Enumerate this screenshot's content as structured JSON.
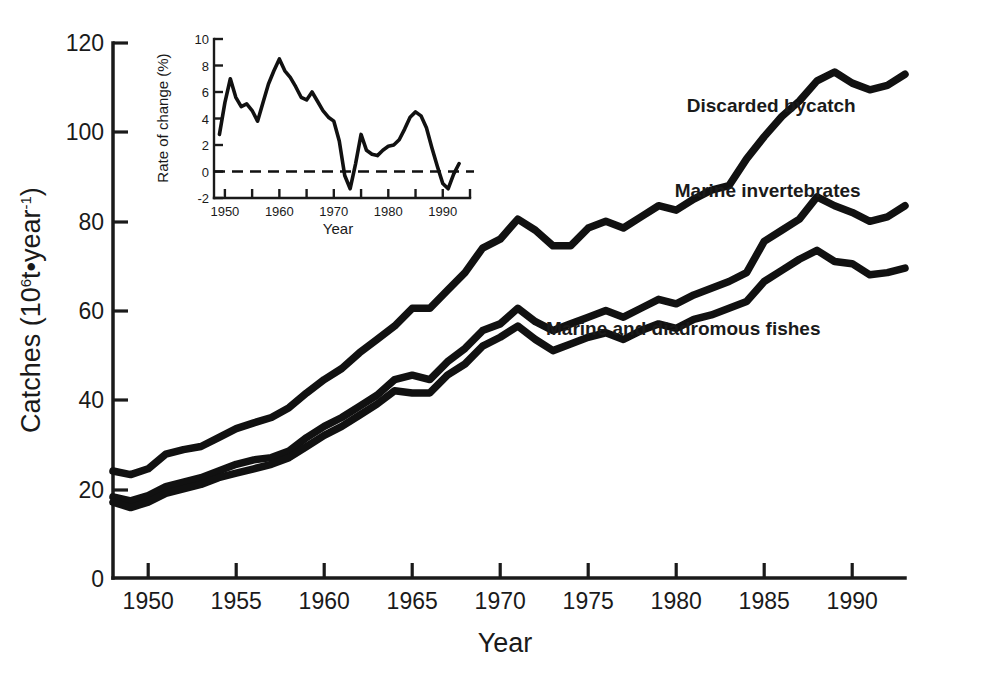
{
  "figure": {
    "name": "world-fisheries-catches-figure",
    "background": "#ffffff",
    "ink_color": "#111111"
  },
  "chart_data": {
    "type": "line",
    "title": "",
    "xlabel": "Year",
    "ylabel": "Catches (10⁶·t·year⁻¹)",
    "ylabel_parts": {
      "prefix": "Catches (10",
      "exponent": "6",
      "mid": "t•year",
      "exp2": "-1",
      "suffix": ")"
    },
    "xlim": [
      1948,
      1993
    ],
    "ylim": [
      0,
      120
    ],
    "xticks": [
      1950,
      1955,
      1960,
      1965,
      1970,
      1975,
      1980,
      1985,
      1990
    ],
    "xticklabels": [
      "1950",
      "1955",
      "1960",
      "1965",
      "1970",
      "1975",
      "1980",
      "1985",
      "1990"
    ],
    "yticks": [
      0,
      20,
      40,
      60,
      80,
      100,
      120
    ],
    "yticklabels": [
      "0",
      "20",
      "40",
      "60",
      "80",
      "100",
      "120"
    ],
    "grid": false,
    "legend_position": "inline-annotations",
    "x": [
      1948,
      1949,
      1950,
      1951,
      1952,
      1953,
      1954,
      1955,
      1956,
      1957,
      1958,
      1959,
      1960,
      1961,
      1962,
      1963,
      1964,
      1965,
      1966,
      1967,
      1968,
      1969,
      1970,
      1971,
      1972,
      1973,
      1974,
      1975,
      1976,
      1977,
      1978,
      1979,
      1980,
      1981,
      1982,
      1983,
      1984,
      1985,
      1986,
      1987,
      1988,
      1989,
      1990,
      1991,
      1992,
      1993
    ],
    "series": [
      {
        "name": "Discarded bycatch",
        "label": "Discarded bycatch",
        "label_xy": [
          1985.4,
          104.5
        ],
        "values": [
          24.0,
          23.2,
          24.5,
          27.8,
          28.8,
          29.5,
          31.5,
          33.5,
          34.8,
          36.0,
          38.2,
          41.5,
          44.5,
          47.0,
          50.5,
          53.5,
          56.5,
          60.5,
          60.5,
          64.5,
          68.5,
          74.0,
          76.0,
          80.5,
          78.0,
          74.5,
          74.5,
          78.5,
          80.0,
          78.5,
          81.0,
          83.5,
          82.5,
          85.0,
          87.0,
          88.0,
          94.0,
          99.0,
          103.5,
          107.0,
          111.5,
          113.5,
          111.0,
          109.5,
          110.5,
          113.0
        ]
      },
      {
        "name": "Marine invertebrates",
        "label": "Marine invertebrates",
        "label_xy": [
          1985.2,
          85.5
        ],
        "values": [
          18.2,
          17.3,
          18.5,
          20.5,
          21.5,
          22.5,
          24.0,
          25.5,
          26.5,
          27.0,
          28.5,
          31.5,
          34.0,
          36.0,
          38.5,
          41.0,
          44.5,
          45.5,
          44.5,
          48.5,
          51.5,
          55.5,
          57.0,
          60.5,
          57.5,
          55.5,
          57.0,
          58.5,
          60.0,
          58.5,
          60.5,
          62.5,
          61.5,
          63.5,
          65.0,
          66.5,
          68.5,
          75.5,
          78.0,
          80.5,
          85.5,
          83.5,
          82.0,
          80.0,
          81.0,
          83.5
        ]
      },
      {
        "name": "Marine and diadromous fishes",
        "label": "Marine and diadromous fishes",
        "label_xy": [
          1980.4,
          54.5
        ],
        "values": [
          17.0,
          15.8,
          17.0,
          19.0,
          20.0,
          21.0,
          22.5,
          23.5,
          24.5,
          25.5,
          27.0,
          29.5,
          32.0,
          34.0,
          36.5,
          39.0,
          42.0,
          41.5,
          41.5,
          45.5,
          48.0,
          52.0,
          54.0,
          56.5,
          53.5,
          51.0,
          52.5,
          54.0,
          55.0,
          53.5,
          55.5,
          57.0,
          56.0,
          58.0,
          59.0,
          60.5,
          62.0,
          66.5,
          69.0,
          71.5,
          73.5,
          71.0,
          70.5,
          68.0,
          68.5,
          69.5
        ]
      }
    ]
  },
  "inset_chart_data": {
    "type": "line",
    "title": "",
    "xlabel": "Year",
    "ylabel": "Rate of change (%)",
    "xlim": [
      1948,
      1995
    ],
    "ylim": [
      -2,
      10
    ],
    "xticks": [
      1950,
      1955,
      1960,
      1965,
      1970,
      1975,
      1980,
      1985,
      1990,
      1995
    ],
    "xticklabels": [
      "1950",
      "",
      "1960",
      "",
      "1970",
      "",
      "1980",
      "",
      "1990",
      ""
    ],
    "xticklabels_shown": [
      "1950",
      "1960",
      "1970",
      "1980",
      "1990"
    ],
    "yticks": [
      -2,
      0,
      2,
      4,
      6,
      8,
      10
    ],
    "yticklabels": [
      "-2",
      "0",
      "2",
      "4",
      "6",
      "8",
      "10"
    ],
    "grid": false,
    "zero_reference_line": 0,
    "zero_line_style": "dashed",
    "x": [
      1949,
      1950,
      1951,
      1952,
      1953,
      1954,
      1955,
      1956,
      1957,
      1958,
      1959,
      1960,
      1961,
      1962,
      1963,
      1964,
      1965,
      1966,
      1967,
      1968,
      1969,
      1970,
      1971,
      1972,
      1973,
      1974,
      1975,
      1976,
      1977,
      1978,
      1979,
      1980,
      1981,
      1982,
      1983,
      1984,
      1985,
      1986,
      1987,
      1988,
      1989,
      1990,
      1991,
      1992,
      1993
    ],
    "values": [
      2.8,
      5.2,
      7.0,
      5.6,
      4.9,
      5.1,
      4.6,
      3.8,
      5.2,
      6.6,
      7.6,
      8.5,
      7.6,
      7.1,
      6.4,
      5.6,
      5.4,
      6.0,
      5.3,
      4.6,
      4.1,
      3.8,
      2.3,
      -0.3,
      -1.3,
      0.6,
      2.8,
      1.6,
      1.3,
      1.2,
      1.6,
      1.9,
      2.0,
      2.4,
      3.2,
      4.1,
      4.5,
      4.2,
      3.3,
      1.8,
      0.4,
      -0.9,
      -1.3,
      -0.2,
      0.6
    ]
  }
}
